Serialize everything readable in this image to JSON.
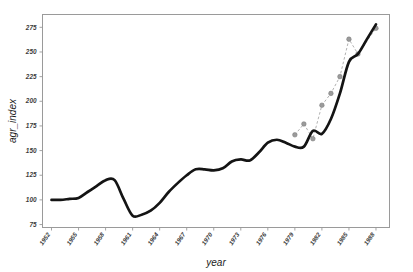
{
  "figure": {
    "background_color": "#ffffff",
    "axis_color": "#9a9a9a",
    "main_line_color": "#141414",
    "overlay_line_color": "#a8a8a8",
    "overlay_marker_color": "#9b9b9b"
  },
  "chart_data": {
    "type": "line",
    "title": "",
    "xlabel": "year",
    "ylabel": "agr_index",
    "xlim": [
      1951,
      1989.5
    ],
    "ylim": [
      72,
      288
    ],
    "grid": false,
    "legend": "none",
    "xticks": [
      1952,
      1955,
      1958,
      1961,
      1964,
      1967,
      1970,
      1973,
      1976,
      1979,
      1982,
      1985,
      1988
    ],
    "xticklabels": [
      "1952",
      "1955",
      "1958",
      "1961",
      "1964",
      "1967",
      "1970",
      "1973",
      "1976",
      "1979",
      "1982",
      "1985",
      "1988"
    ],
    "yticks": [
      75,
      100,
      125,
      150,
      175,
      200,
      225,
      250,
      275
    ],
    "yticklabels": [
      "75",
      "100",
      "125",
      "150",
      "175",
      "200",
      "225",
      "250",
      "275"
    ],
    "series": [
      {
        "name": "agr_index",
        "style": "solid",
        "color": "#141414",
        "marker": "none",
        "x": [
          1952,
          1953,
          1954,
          1955,
          1956,
          1957,
          1958,
          1959,
          1960,
          1961,
          1962,
          1963,
          1964,
          1965,
          1966,
          1967,
          1968,
          1969,
          1970,
          1971,
          1972,
          1973,
          1974,
          1975,
          1976,
          1977,
          1978,
          1979,
          1980,
          1981,
          1982,
          1983,
          1984,
          1985,
          1986,
          1987,
          1988
        ],
        "values": [
          100,
          100,
          101,
          102,
          108,
          114,
          120,
          120,
          101,
          84,
          85,
          89,
          97,
          108,
          117,
          125,
          131,
          131,
          130,
          132,
          139,
          141,
          140,
          148,
          158,
          161,
          158,
          154,
          154,
          170,
          167,
          182,
          208,
          240,
          248,
          263,
          278
        ]
      },
      {
        "name": "agr_index_alt",
        "style": "dashed",
        "color": "#a8a8a8",
        "marker": "circle",
        "x": [
          1979,
          1980,
          1981,
          1982,
          1983,
          1984,
          1985,
          1986,
          1988
        ],
        "values": [
          166,
          177,
          162,
          196,
          208,
          225,
          263,
          248,
          274
        ]
      }
    ]
  }
}
